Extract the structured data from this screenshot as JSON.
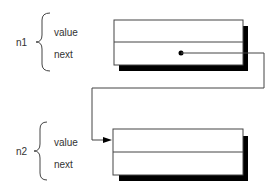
{
  "nodes": [
    {
      "name": "n1",
      "fields": [
        "value",
        "next"
      ]
    },
    {
      "name": "n2",
      "fields": [
        "value",
        "next"
      ]
    }
  ],
  "colors": {
    "stroke": "#444444",
    "shadow": "#000000",
    "text": "#333333"
  }
}
